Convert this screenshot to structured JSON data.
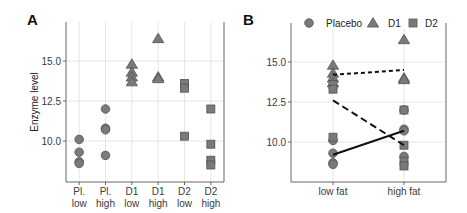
{
  "chart_data": [
    {
      "panel": "A",
      "type": "scatter",
      "title": "",
      "xlabel": "",
      "ylabel": "Enzyme level",
      "ylim": [
        7.5,
        17.5
      ],
      "yticks": [
        10.0,
        12.5,
        15.0
      ],
      "ytick_labels": [
        "10.0",
        "12.5",
        "15.0"
      ],
      "grid": true,
      "categories": [
        "Pl.\nlow",
        "Pl.\nhigh",
        "D1\nlow",
        "D1\nhigh",
        "D2\nlow",
        "D2\nhigh"
      ],
      "category_lines": [
        [
          "Pl.",
          "low"
        ],
        [
          "Pl.",
          "high"
        ],
        [
          "D1",
          "low"
        ],
        [
          "D1",
          "high"
        ],
        [
          "D2",
          "low"
        ],
        [
          "D2",
          "high"
        ]
      ],
      "groups": [
        {
          "category": "Pl. low",
          "marker": "circle",
          "values": [
            10.1,
            9.3,
            8.7,
            8.6
          ]
        },
        {
          "category": "Pl. high",
          "marker": "circle",
          "values": [
            12.0,
            10.8,
            10.7,
            9.1
          ]
        },
        {
          "category": "D1 low",
          "marker": "triangle",
          "values": [
            14.8,
            14.3,
            14.0,
            13.7
          ]
        },
        {
          "category": "D1 high",
          "marker": "triangle",
          "values": [
            16.4,
            14.0,
            13.9
          ]
        },
        {
          "category": "D2 low",
          "marker": "square",
          "values": [
            13.6,
            13.3,
            10.3
          ]
        },
        {
          "category": "D2 high",
          "marker": "square",
          "values": [
            12.0,
            9.8,
            8.8,
            8.5
          ]
        }
      ]
    },
    {
      "panel": "B",
      "type": "line",
      "title": "",
      "xlabel": "",
      "ylabel": "",
      "ylim": [
        7.5,
        17.5
      ],
      "yticks": [
        10.0,
        12.5,
        15.0
      ],
      "ytick_labels": [
        "10.0",
        "12.5",
        "15.0"
      ],
      "grid": true,
      "categories": [
        "low fat",
        "high fat"
      ],
      "legend": {
        "position": "top",
        "entries": [
          {
            "label": "Placebo",
            "marker": "circle"
          },
          {
            "label": "D1",
            "marker": "triangle"
          },
          {
            "label": "D2",
            "marker": "square"
          }
        ]
      },
      "series": [
        {
          "name": "Placebo",
          "marker": "circle",
          "line_style": "solid",
          "points": {
            "low fat": [
              10.1,
              9.3,
              8.7,
              8.6
            ],
            "high fat": [
              12.0,
              10.8,
              10.7,
              9.1
            ]
          },
          "means": [
            9.2,
            10.7
          ]
        },
        {
          "name": "D1",
          "marker": "triangle",
          "line_style": "dotted",
          "points": {
            "low fat": [
              14.8,
              14.3,
              14.0,
              13.7
            ],
            "high fat": [
              16.4,
              14.0,
              13.9
            ]
          },
          "means": [
            14.2,
            14.5
          ]
        },
        {
          "name": "D2",
          "marker": "square",
          "line_style": "dashed",
          "points": {
            "low fat": [
              13.6,
              13.3,
              10.3
            ],
            "high fat": [
              12.0,
              9.8,
              8.8,
              8.5
            ]
          },
          "means": [
            12.6,
            9.8
          ]
        }
      ]
    }
  ],
  "panels": {
    "a": {
      "label": "A",
      "ylabel": "Enzyme level"
    },
    "b": {
      "label": "B",
      "legend": [
        "Placebo",
        "D1",
        "D2"
      ]
    }
  },
  "colors": {
    "marker_fill": "#7a7a7a",
    "marker_stroke": "#555555",
    "grid": "#e6e6e6",
    "axis": "#666666",
    "line": "#111111"
  }
}
